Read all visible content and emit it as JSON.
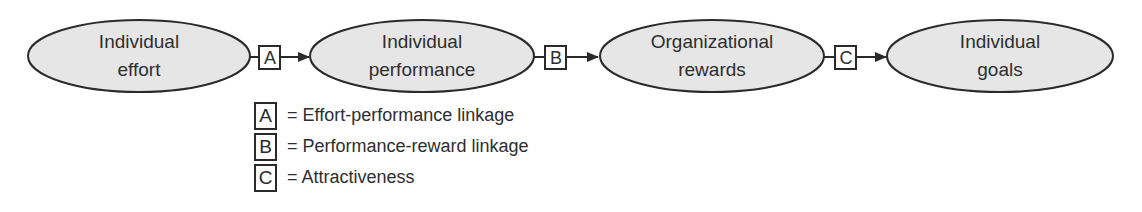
{
  "diagram": {
    "nodes": [
      {
        "id": "individual-effort",
        "line1": "Individual",
        "line2": "effort"
      },
      {
        "id": "individual-performance",
        "line1": "Individual",
        "line2": "performance"
      },
      {
        "id": "organizational-rewards",
        "line1": "Organizational",
        "line2": "rewards"
      },
      {
        "id": "individual-goals",
        "line1": "Individual",
        "line2": "goals"
      }
    ],
    "links": [
      {
        "label": "A",
        "from": "individual-effort",
        "to": "individual-performance"
      },
      {
        "label": "B",
        "from": "individual-performance",
        "to": "organizational-rewards"
      },
      {
        "label": "C",
        "from": "organizational-rewards",
        "to": "individual-goals"
      }
    ],
    "colors": {
      "node_fill": "#e6e6e6",
      "stroke": "#2a2a2a",
      "text": "#2e2e2e"
    }
  },
  "legend": [
    {
      "key": "A",
      "text": "= Effort-performance linkage"
    },
    {
      "key": "B",
      "text": "= Performance-reward linkage"
    },
    {
      "key": "C",
      "text": "= Attractiveness"
    }
  ]
}
